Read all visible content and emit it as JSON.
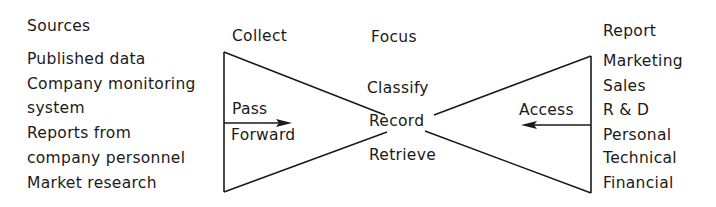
{
  "diagram": {
    "type": "double-funnel information flow",
    "headings": {
      "sources": "Sources",
      "collect": "Collect",
      "focus": "Focus",
      "report": "Report"
    },
    "sources": [
      "Published data",
      "Company monitoring",
      "system",
      "Reports from",
      "company personnel",
      "Market research"
    ],
    "left_arrow": {
      "label_top": "Pass",
      "label_bottom": "Forward",
      "direction": "right"
    },
    "focus_steps": [
      "Classify",
      "Record",
      "Retrieve"
    ],
    "right_arrow": {
      "label": "Access",
      "direction": "left"
    },
    "reports": [
      "Marketing",
      "Sales",
      "R & D",
      "Personal",
      "Technical",
      "Financial"
    ],
    "line_color": "#1a1a1a"
  }
}
